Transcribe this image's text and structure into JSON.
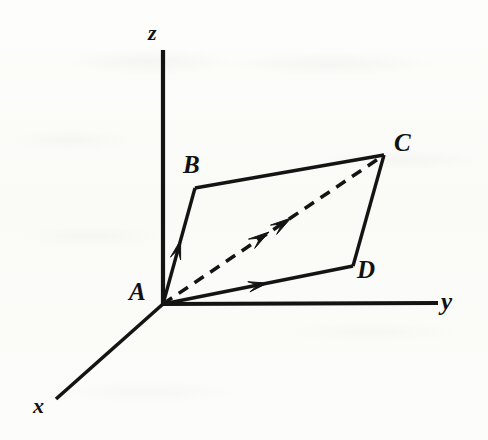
{
  "figure": {
    "kind": "3d-vector-parallelogram-diagram",
    "background_color": "#fbfbf9",
    "ink_color": "#111111",
    "axes": [
      {
        "id": "z",
        "label": "z",
        "from": [
          163,
          304
        ],
        "to": [
          163,
          50
        ]
      },
      {
        "id": "y",
        "label": "y",
        "from": [
          163,
          304
        ],
        "to": [
          438,
          303
        ]
      },
      {
        "id": "x",
        "label": "x",
        "from": [
          163,
          304
        ],
        "to": [
          56,
          399
        ]
      }
    ],
    "vertices": [
      {
        "id": "A",
        "label": "A",
        "point": [
          163,
          304
        ]
      },
      {
        "id": "B",
        "label": "B",
        "point": [
          195,
          188
        ]
      },
      {
        "id": "C",
        "label": "C",
        "point": [
          384,
          155
        ]
      },
      {
        "id": "D",
        "label": "D",
        "point": [
          353,
          266
        ]
      }
    ],
    "edges": [
      {
        "id": "AB",
        "from": "A",
        "to": "B",
        "style": "solid",
        "arrow": "midpoint"
      },
      {
        "id": "BC",
        "from": "B",
        "to": "C",
        "style": "solid",
        "arrow": "none"
      },
      {
        "id": "AD",
        "from": "A",
        "to": "D",
        "style": "solid",
        "arrow": "midpoint"
      },
      {
        "id": "DC",
        "from": "D",
        "to": "C",
        "style": "solid",
        "arrow": "none"
      }
    ],
    "diagonal": {
      "id": "AC",
      "from": "A",
      "to": "C",
      "style": "dashed",
      "dash_pattern": "11 8",
      "arrows": 2,
      "arrow_positions": [
        [
          269,
          232
        ],
        [
          291,
          218
        ]
      ]
    }
  }
}
